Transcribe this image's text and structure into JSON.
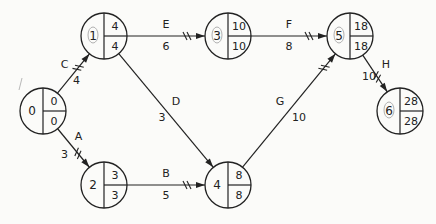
{
  "diagram": {
    "type": "activity-on-arrow network (CPM)",
    "colors": {
      "line": "#222222",
      "background": "#fbfbf9",
      "circle_mark": "#b0b0b0"
    },
    "nodes": [
      {
        "id": "0",
        "x": 43,
        "y": 111,
        "es": "0",
        "lf": "0",
        "marked": false
      },
      {
        "id": "1",
        "x": 104,
        "y": 36,
        "es": "4",
        "lf": "4",
        "marked": true
      },
      {
        "id": "2",
        "x": 104,
        "y": 185,
        "es": "3",
        "lf": "3",
        "marked": false
      },
      {
        "id": "3",
        "x": 228,
        "y": 36,
        "es": "10",
        "lf": "10",
        "marked": true
      },
      {
        "id": "4",
        "x": 228,
        "y": 185,
        "es": "8",
        "lf": "8",
        "marked": false
      },
      {
        "id": "5",
        "x": 350,
        "y": 36,
        "es": "18",
        "lf": "18",
        "marked": true
      },
      {
        "id": "6",
        "x": 400,
        "y": 111,
        "es": "28",
        "lf": "28",
        "marked": true
      }
    ],
    "activities": [
      {
        "name": "C",
        "duration": "4",
        "from": "0",
        "to": "1",
        "critical": true
      },
      {
        "name": "A",
        "duration": "3",
        "from": "0",
        "to": "2",
        "critical": true
      },
      {
        "name": "E",
        "duration": "6",
        "from": "1",
        "to": "3",
        "critical": true
      },
      {
        "name": "D",
        "duration": "3",
        "from": "1",
        "to": "4",
        "critical": false
      },
      {
        "name": "B",
        "duration": "5",
        "from": "2",
        "to": "4",
        "critical": true
      },
      {
        "name": "F",
        "duration": "8",
        "from": "3",
        "to": "5",
        "critical": true
      },
      {
        "name": "G",
        "duration": "10",
        "from": "4",
        "to": "5",
        "critical": true
      },
      {
        "name": "H",
        "duration": "10",
        "from": "5",
        "to": "6",
        "critical": true
      }
    ]
  }
}
